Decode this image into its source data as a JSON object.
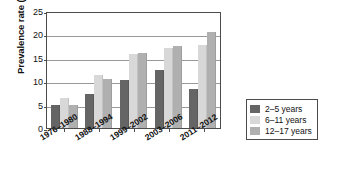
{
  "chart_data": {
    "type": "bar",
    "title": "",
    "xlabel": "",
    "ylabel": "Prevalence rate (%)",
    "categories": [
      "1976–1980",
      "1988–1994",
      "1999–2002",
      "2003–2006",
      "2011–2012"
    ],
    "series": [
      {
        "name": "2–5 years",
        "color": "#656565",
        "values": [
          5.0,
          7.2,
          10.3,
          12.4,
          8.4
        ]
      },
      {
        "name": "6–11 years",
        "color": "#d8d8d8",
        "values": [
          6.5,
          11.3,
          15.8,
          17.0,
          17.7
        ]
      },
      {
        "name": "12–17 years",
        "color": "#b0b0b0",
        "values": [
          5.0,
          10.5,
          16.1,
          17.6,
          20.5
        ]
      }
    ],
    "ylim": [
      0,
      25
    ],
    "yticks": [
      0,
      5,
      10,
      15,
      20,
      25
    ],
    "grid": true,
    "legend_position": "right"
  },
  "legend": {
    "items": [
      {
        "label": "2–5 years"
      },
      {
        "label": "6–11 years"
      },
      {
        "label": "12–17 years"
      }
    ]
  }
}
